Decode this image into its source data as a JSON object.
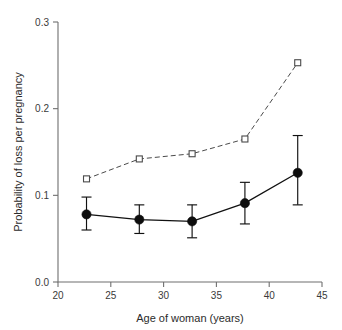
{
  "chart_data": {
    "type": "line",
    "title": "",
    "xlabel": "Age of woman (years)",
    "ylabel": "Probability of loss per pregnancy",
    "xlim": [
      20,
      45
    ],
    "ylim": [
      0.0,
      0.3
    ],
    "xticks": [
      20,
      25,
      30,
      35,
      40,
      45
    ],
    "xtick_labels": [
      "20",
      "25",
      "30",
      "35",
      "40",
      "45"
    ],
    "yticks": [
      0.0,
      0.1,
      0.2,
      0.3
    ],
    "ytick_labels": [
      "0.0",
      "0.1",
      "0.2",
      "0.3"
    ],
    "grid": false,
    "legend": "none",
    "x": [
      22.7,
      27.7,
      32.7,
      37.7,
      42.7
    ],
    "series": [
      {
        "name": "filled-circles",
        "marker": "filled-circle",
        "linestyle": "solid",
        "color": "#0d0d0d",
        "values": [
          0.078,
          0.072,
          0.07,
          0.091,
          0.126
        ],
        "error_low": [
          0.06,
          0.056,
          0.051,
          0.067,
          0.089
        ],
        "error_high": [
          0.098,
          0.089,
          0.089,
          0.115,
          0.169
        ]
      },
      {
        "name": "open-squares",
        "marker": "open-square",
        "linestyle": "dashed",
        "color": "#4a4a4a",
        "values": [
          0.119,
          0.142,
          0.148,
          0.165,
          0.253
        ],
        "error_low": null,
        "error_high": null
      }
    ]
  },
  "figure": {
    "background_color": "#ffffff",
    "axis_color": "#6f6f6f",
    "tick_label_color": "#3a3a3a",
    "axis_title_color": "#2b2b2b"
  }
}
